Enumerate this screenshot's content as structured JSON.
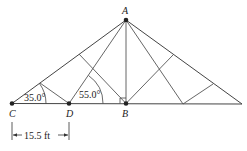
{
  "diagram": {
    "type": "truss",
    "points": {
      "A": {
        "label": "A"
      },
      "B": {
        "label": "B"
      },
      "C": {
        "label": "C"
      },
      "D": {
        "label": "D"
      }
    },
    "angles": {
      "at_C": "35.0°",
      "at_D": "55.0°"
    },
    "dimension": {
      "CD": "15.5 ft"
    },
    "right_angle_at": "B"
  }
}
